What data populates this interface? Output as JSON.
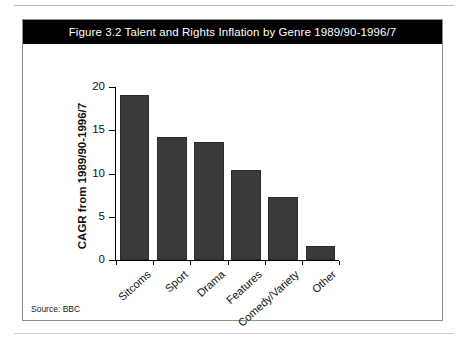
{
  "figure": {
    "title": "Figure 3.2 Talent and Rights Inflation by Genre 1989/90-1996/7",
    "source_note": "Source: BBC"
  },
  "chart_data": {
    "type": "bar",
    "title": "Figure 3.2 Talent and Rights Inflation by Genre 1989/90-1996/7",
    "categories": [
      "Sitcoms",
      "Sport",
      "Drama",
      "Features",
      "Comedy/Variety",
      "Other"
    ],
    "values": [
      19.1,
      14.2,
      13.7,
      10.4,
      7.3,
      1.6
    ],
    "xlabel": "",
    "ylabel": "CAGR from 1989/90-1996/7",
    "ylim": [
      0,
      20
    ],
    "yticks": [
      0,
      5,
      10,
      15,
      20
    ],
    "ytick_labels": [
      "0",
      "5",
      "10",
      "15",
      "20"
    ],
    "grid": false,
    "legend": false,
    "bar_color": "#3a3a3a",
    "source": "Source: BBC"
  }
}
